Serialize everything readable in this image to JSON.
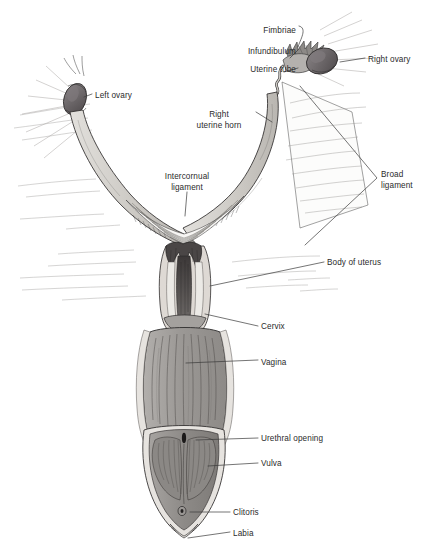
{
  "figure": {
    "domain": "anatomical-illustration",
    "background_color": "#ffffff",
    "line_color": "#1a1a1a",
    "label_color": "#2b2b2b",
    "leader_color": "#3a3a3a",
    "palette": {
      "ovary_dark": "#6f6a6c",
      "ovary_shade": "#4e494b",
      "tube_light": "#d8d6d2",
      "horn_light": "#cfccc7",
      "ligament_pale": "#f2f1ee",
      "uterus_body": "#b9b6b2",
      "cervix_dark": "#4a4646",
      "vagina_mid": "#9d9a97",
      "vulva_mid": "#8f8c89",
      "outline_pale": "#e9e8e5"
    }
  },
  "labels": [
    {
      "id": "fimbriae",
      "text": "Fimbriae",
      "lines": [
        "Fimbriae"
      ],
      "x": 234,
      "y": 26,
      "align": "right",
      "w": 62
    },
    {
      "id": "infundibulum",
      "text": "Infundibulum",
      "lines": [
        "Infundibulum"
      ],
      "x": 205,
      "y": 47,
      "align": "right",
      "w": 91
    },
    {
      "id": "uterine-tube",
      "text": "Uterine tube",
      "lines": [
        "Uterine tube"
      ],
      "x": 208,
      "y": 65,
      "align": "right",
      "w": 88
    },
    {
      "id": "right-ovary",
      "text": "Right ovary",
      "lines": [
        "Right ovary"
      ],
      "x": 368,
      "y": 55,
      "align": "left",
      "w": 60
    },
    {
      "id": "left-ovary",
      "text": "Left ovary",
      "lines": [
        "Left ovary"
      ],
      "x": 95,
      "y": 91,
      "align": "left",
      "w": 58
    },
    {
      "id": "right-uterine-horn",
      "text": "Right uterine horn",
      "lines": [
        "Right",
        "uterine horn"
      ],
      "x": 186,
      "y": 110,
      "align": "center",
      "w": 66
    },
    {
      "id": "intercornual-ligament",
      "text": "Intercornual ligament",
      "lines": [
        "Intercornual",
        "ligament"
      ],
      "x": 152,
      "y": 172,
      "align": "center",
      "w": 70
    },
    {
      "id": "broad-ligament",
      "text": "Broad ligament",
      "lines": [
        "Broad",
        "ligament"
      ],
      "x": 381,
      "y": 170,
      "align": "left",
      "w": 48
    },
    {
      "id": "body-of-uterus",
      "text": "Body of uterus",
      "lines": [
        "Body of uterus"
      ],
      "x": 327,
      "y": 258,
      "align": "left",
      "w": 80
    },
    {
      "id": "cervix",
      "text": "Cervix",
      "lines": [
        "Cervix"
      ],
      "x": 261,
      "y": 322,
      "align": "left",
      "w": 40
    },
    {
      "id": "vagina",
      "text": "Vagina",
      "lines": [
        "Vagina"
      ],
      "x": 261,
      "y": 358,
      "align": "left",
      "w": 40
    },
    {
      "id": "urethral-opening",
      "text": "Urethral opening",
      "lines": [
        "Urethral opening"
      ],
      "x": 261,
      "y": 434,
      "align": "left",
      "w": 88
    },
    {
      "id": "vulva",
      "text": "Vulva",
      "lines": [
        "Vulva"
      ],
      "x": 261,
      "y": 459,
      "align": "left",
      "w": 36
    },
    {
      "id": "clitoris",
      "text": "Clitoris",
      "lines": [
        "Clitoris"
      ],
      "x": 233,
      "y": 508,
      "align": "left",
      "w": 42
    },
    {
      "id": "labia",
      "text": "Labia",
      "lines": [
        "Labia"
      ],
      "x": 233,
      "y": 529,
      "align": "left",
      "w": 34
    }
  ],
  "structures": [
    {
      "id": "right-ovary-body",
      "name": "Right ovary",
      "shape": "ovoid",
      "fill": "#6f6a6c"
    },
    {
      "id": "left-ovary-body",
      "name": "Left ovary",
      "shape": "ovoid",
      "fill": "#6f6a6c"
    },
    {
      "id": "fimbriae-fringe",
      "name": "Fimbriae",
      "shape": "spiked-fringe"
    },
    {
      "id": "infundibulum-funnel",
      "name": "Infundibulum",
      "shape": "funnel"
    },
    {
      "id": "uterine-tube-path",
      "name": "Uterine tube",
      "shape": "coiled-tube"
    },
    {
      "id": "right-horn-body",
      "name": "Right uterine horn",
      "shape": "curved-horn"
    },
    {
      "id": "left-horn-body",
      "name": "Left uterine horn",
      "shape": "curved-horn"
    },
    {
      "id": "intercornual-web",
      "name": "Intercornual ligament",
      "shape": "hatched-web"
    },
    {
      "id": "broad-ligament-sheet",
      "name": "Broad ligament",
      "shape": "sheet-with-striae"
    },
    {
      "id": "uterus-body-block",
      "name": "Body of uterus",
      "shape": "short-tube"
    },
    {
      "id": "cervix-block",
      "name": "Cervix",
      "shape": "ridged-canal"
    },
    {
      "id": "vagina-block",
      "name": "Vagina",
      "shape": "striated-tube"
    },
    {
      "id": "vulva-block",
      "name": "Vulva",
      "shape": "bilobed"
    },
    {
      "id": "urethral-slit",
      "name": "Urethral opening",
      "shape": "slit"
    },
    {
      "id": "clitoris-node",
      "name": "Clitoris",
      "shape": "small-node"
    },
    {
      "id": "labia-apex",
      "name": "Labia",
      "shape": "apex"
    }
  ]
}
